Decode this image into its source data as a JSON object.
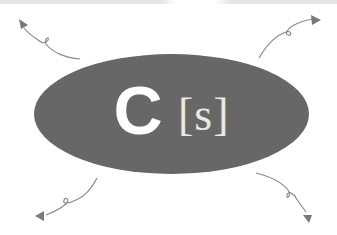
{
  "diagram": {
    "center_shape": "ellipse",
    "logo": {
      "primary_letter": "C",
      "bracketed_text": "[s]"
    },
    "arrows": [
      {
        "name": "arrow-top-left",
        "direction": "up-left"
      },
      {
        "name": "arrow-top-right",
        "direction": "up-right"
      },
      {
        "name": "arrow-bottom-left",
        "direction": "down-left"
      },
      {
        "name": "arrow-bottom-right",
        "direction": "down-right"
      }
    ],
    "colors": {
      "ellipse": "#676767",
      "logo_text": "#ffffff",
      "arrow": "#8a8a8a",
      "background": "#ffffff"
    }
  }
}
